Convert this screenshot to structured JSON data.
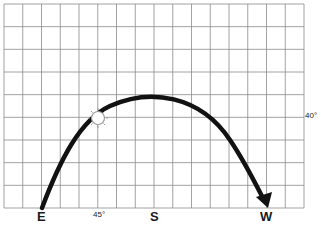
{
  "diagram": {
    "grid": {
      "columns": 16,
      "rows": 9
    },
    "directions": {
      "east": "E",
      "south": "S",
      "west": "W"
    },
    "angle_labels": {
      "azimuth": "45°",
      "altitude": "40°"
    },
    "sun_icon": "sun-icon",
    "arrow_icon": "arrow-head-icon",
    "colors": {
      "grid": "#8a8a8a",
      "path": "#111111",
      "background": "#ffffff"
    }
  }
}
